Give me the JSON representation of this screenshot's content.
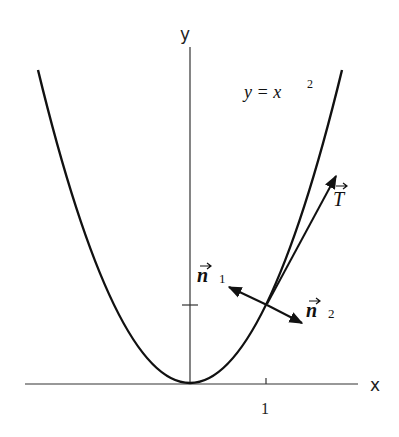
{
  "figure": {
    "axes": {
      "x_label": "x",
      "y_label": "y",
      "x_tick_label": "1",
      "origin_px": [
        190,
        383
      ],
      "unit_px": 77
    },
    "curve": {
      "equation_lhs": "y = x",
      "equation_exponent": "2",
      "description": "parabola y = x^2"
    },
    "vectors": {
      "tangent": {
        "symbol": "T",
        "label": "T"
      },
      "normal1": {
        "symbol": "n",
        "subscript": "1"
      },
      "normal2": {
        "symbol": "n",
        "subscript": "2"
      }
    },
    "colors": {
      "ink": "#111111",
      "axis": "#333333",
      "background": "#ffffff"
    }
  }
}
